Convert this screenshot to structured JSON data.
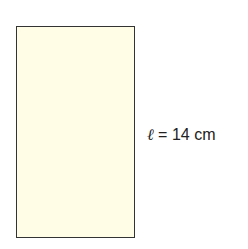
{
  "figure": {
    "shape": "rectangle",
    "fill_color": "#fffde6",
    "stroke_color": "#333333",
    "length_label": {
      "variable": "ℓ",
      "equals": " = ",
      "value": "14",
      "unit": " cm"
    }
  }
}
